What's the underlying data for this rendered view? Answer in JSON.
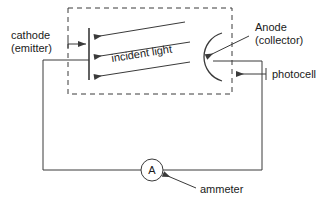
{
  "figure": {
    "background_color": "#ffffff",
    "line_color": "#3a3a3a",
    "text_color": "#1a1a1a"
  },
  "labels": {
    "cathode_line1": "cathode",
    "cathode_line2": "(emitter)",
    "anode_line1": "Anode",
    "anode_line2": "(collector)",
    "photocell": "photocell",
    "ammeter": "ammeter",
    "incident_light": "incident light",
    "ammeter_symbol": "A"
  },
  "components": {
    "cathode": {
      "name": "cathode-plate",
      "shape": "vertical-line",
      "x": 89,
      "y_top": 28,
      "y_bottom": 80
    },
    "anode": {
      "name": "anode-arc",
      "shape": "arc-open-left",
      "center_x": 213,
      "center_y": 57,
      "radius": 25
    },
    "ammeter": {
      "name": "ammeter-symbol",
      "shape": "circle",
      "center_x": 152,
      "center_y": 170,
      "radius": 11
    },
    "photocell_enclosure": {
      "name": "photocell-dashed-box",
      "shape": "dashed-rectangle",
      "x": 68,
      "y": 8,
      "width": 164,
      "height": 86
    },
    "light_rays": {
      "name": "incident-light-rays",
      "count": 3,
      "direction": "right-to-left",
      "arrowhead": "left"
    }
  }
}
